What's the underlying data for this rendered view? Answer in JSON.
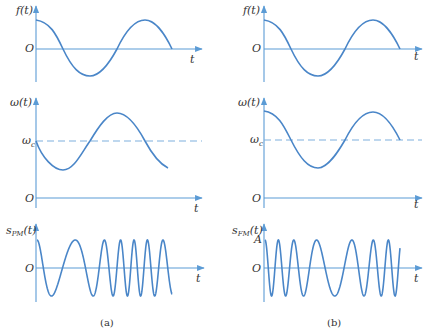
{
  "figure": {
    "panels": [
      {
        "id": "a",
        "caption": "(a)",
        "plots": [
          {
            "ylabel": "f(t)",
            "origin": "O",
            "xlabel": "t"
          },
          {
            "ylabel": "ω(t)",
            "origin": "O",
            "xlabel": "t",
            "reference_label": "ω",
            "reference_sub": "c"
          },
          {
            "ylabel": "s",
            "ylabel_sub": "PM",
            "ylabel_tail": "(t)",
            "origin": "O",
            "xlabel": "t"
          }
        ]
      },
      {
        "id": "b",
        "caption": "(b)",
        "plots": [
          {
            "ylabel": "f(t)",
            "origin": "O",
            "xlabel": "t"
          },
          {
            "ylabel": "ω(t)",
            "origin": "O",
            "xlabel": "t",
            "reference_label": "ω",
            "reference_sub": "c"
          },
          {
            "ylabel": "s",
            "ylabel_sub": "FM",
            "ylabel_tail": "(t)",
            "origin": "O",
            "xlabel": "t",
            "amplitude_label": "A"
          }
        ]
      }
    ],
    "colors": {
      "curve": "#4a86c8",
      "axis": "#5b9bd5",
      "dash": "#7fb0dd",
      "text": "#333333"
    }
  }
}
